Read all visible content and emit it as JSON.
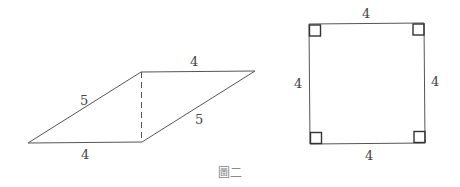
{
  "figure": {
    "caption": "圖二",
    "stroke_color": "#555555",
    "text_color": "#444444"
  },
  "parallelogram": {
    "vertices": {
      "bottom_left": [
        28,
        143
      ],
      "bottom_right": [
        142,
        142
      ],
      "top_left": [
        141,
        72
      ],
      "top_right": [
        255,
        71
      ]
    },
    "height_line": "dashed",
    "labels": {
      "top": "4",
      "bottom": "4",
      "left": "5",
      "right": "5"
    }
  },
  "square": {
    "vertices": {
      "top_left": [
        309,
        24
      ],
      "top_right": [
        424,
        23
      ],
      "bottom_left": [
        310,
        144
      ],
      "bottom_right": [
        425,
        143
      ]
    },
    "right_angle_marks": 4,
    "labels": {
      "top": "4",
      "bottom": "4",
      "left": "4",
      "right": "4"
    }
  }
}
